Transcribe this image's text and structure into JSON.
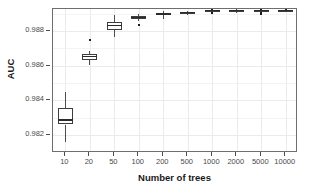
{
  "chart_data": {
    "type": "box",
    "title": "",
    "xlabel": "Number of trees",
    "ylabel": "AUC",
    "categories": [
      "10",
      "20",
      "50",
      "100",
      "200",
      "500",
      "1000",
      "2000",
      "5000",
      "10000"
    ],
    "yticks": [
      "0.982",
      "0.984",
      "0.986",
      "0.988"
    ],
    "ytick_values": [
      0.982,
      0.984,
      0.986,
      0.988
    ],
    "ylim": [
      0.98097,
      0.98926
    ],
    "grid": true,
    "legend": "none",
    "boxes": [
      {
        "category": "10",
        "whisker_low": 0.98159,
        "q1": 0.98261,
        "median": 0.98287,
        "q3": 0.98355,
        "whisker_high": 0.98448,
        "outliers": []
      },
      {
        "category": "20",
        "whisker_low": 0.98604,
        "q1": 0.98632,
        "median": 0.98652,
        "q3": 0.98665,
        "whisker_high": 0.98684,
        "outliers": [
          0.98749
        ]
      },
      {
        "category": "50",
        "whisker_low": 0.98762,
        "q1": 0.98806,
        "median": 0.98832,
        "q3": 0.98852,
        "whisker_high": 0.9889,
        "outliers": []
      },
      {
        "category": "100",
        "whisker_low": 0.98855,
        "q1": 0.98871,
        "median": 0.98877,
        "q3": 0.98884,
        "whisker_high": 0.98897,
        "outliers": [
          0.98832
        ]
      },
      {
        "category": "200",
        "whisker_low": 0.98868,
        "q1": 0.9889,
        "median": 0.98897,
        "q3": 0.98903,
        "whisker_high": 0.98916,
        "outliers": []
      },
      {
        "category": "500",
        "whisker_low": 0.9889,
        "q1": 0.98903,
        "median": 0.98906,
        "q3": 0.9891,
        "whisker_high": 0.98916,
        "outliers": []
      },
      {
        "category": "1000",
        "whisker_low": 0.98906,
        "q1": 0.98913,
        "median": 0.98916,
        "q3": 0.98919,
        "whisker_high": 0.98922,
        "outliers": [
          0.98903,
          0.98929
        ]
      },
      {
        "category": "2000",
        "whisker_low": 0.98903,
        "q1": 0.98913,
        "median": 0.98916,
        "q3": 0.98919,
        "whisker_high": 0.98926,
        "outliers": []
      },
      {
        "category": "5000",
        "whisker_low": 0.9891,
        "q1": 0.98916,
        "median": 0.98916,
        "q3": 0.98919,
        "whisker_high": 0.98922,
        "outliers": [
          0.989,
          0.98929
        ]
      },
      {
        "category": "10000",
        "whisker_low": 0.9891,
        "q1": 0.98913,
        "median": 0.98916,
        "q3": 0.98919,
        "whisker_high": 0.98922,
        "outliers": [
          0.98929
        ]
      }
    ]
  },
  "colors": {
    "panel_background": "#ffffff",
    "panel_border": "#6e6e6e",
    "grid_major": "#ebebeb",
    "grid_minor": "#f4f4f4",
    "box_line": "#3d3d3d",
    "median_line": "#2b2b2b",
    "whisker": "#4d4d4d",
    "outlier": "#1a1a1a",
    "axis_text": "#4a4a4a",
    "axis_title": "#1a1a1a"
  }
}
